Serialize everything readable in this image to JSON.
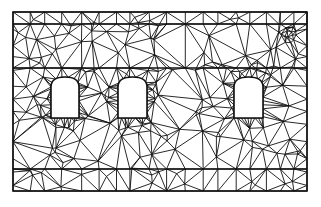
{
  "diagram": {
    "type": "triangulated-mesh",
    "colors": {
      "background": "#ffffff",
      "stroke": "#111111"
    },
    "frame": {
      "x": 13,
      "y": 12,
      "width": 294,
      "height": 179
    },
    "bands": [
      24,
      68,
      169
    ],
    "openings": [
      {
        "id": "window-1",
        "x": 51,
        "y": 77,
        "width": 28,
        "height": 41
      },
      {
        "id": "window-2",
        "x": 118,
        "y": 77,
        "width": 29,
        "height": 41
      },
      {
        "id": "window-3",
        "x": 234,
        "y": 77,
        "width": 29,
        "height": 41
      }
    ],
    "refinement_point": {
      "x": 289,
      "y": 35
    }
  }
}
